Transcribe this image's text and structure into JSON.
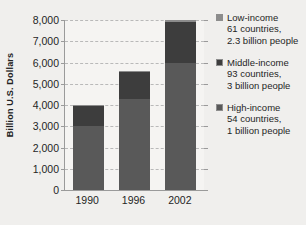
{
  "chart_data": {
    "type": "bar",
    "stacked": true,
    "title": "",
    "subtitle": "",
    "xlabel": "",
    "ylabel": "Billion U.S. Dollars",
    "categories": [
      "1990",
      "1996",
      "2002"
    ],
    "ylim": [
      0,
      8000
    ],
    "ytick_labels": [
      "0",
      "1,000",
      "2,000",
      "3,000",
      "4,000",
      "5,000",
      "6,000",
      "7,000",
      "8,000"
    ],
    "ytick_values": [
      0,
      1000,
      2000,
      3000,
      4000,
      5000,
      6000,
      7000,
      8000
    ],
    "grid": true,
    "grid_style": "dashed-horizontal",
    "legend_position": "right",
    "series": [
      {
        "name": "High-income",
        "color": "#595959",
        "values": [
          3000,
          4300,
          6000
        ]
      },
      {
        "name": "Middle-income",
        "color": "#3d3d3d",
        "values": [
          950,
          1250,
          1900
        ]
      },
      {
        "name": "Low-income",
        "color": "#8c8c8c",
        "values": [
          50,
          60,
          100
        ]
      }
    ],
    "totals": [
      4000,
      5610,
      8000
    ]
  },
  "axes": {
    "y_title": "Billion U.S. Dollars",
    "y_ticks": [
      {
        "label": "8,000",
        "value": 8000
      },
      {
        "label": "7,000",
        "value": 7000
      },
      {
        "label": "6,000",
        "value": 6000
      },
      {
        "label": "5,000",
        "value": 5000
      },
      {
        "label": "4,000",
        "value": 4000
      },
      {
        "label": "3,000",
        "value": 3000
      },
      {
        "label": "2,000",
        "value": 2000
      },
      {
        "label": "1,000",
        "value": 1000
      },
      {
        "label": "0",
        "value": 0
      }
    ],
    "x_ticks": [
      {
        "label": "1990"
      },
      {
        "label": "1996"
      },
      {
        "label": "2002"
      }
    ]
  },
  "legend": {
    "entries": [
      {
        "title": "Low-income",
        "line1": "61 countries,",
        "line2": "2.3 billion people",
        "color": "#8c8c8c"
      },
      {
        "title": "Middle-income",
        "line1": "93 countries,",
        "line2": "3 billion people",
        "color": "#3d3d3d"
      },
      {
        "title": "High-income",
        "line1": "54 countries,",
        "line2": "1 billion people",
        "color": "#595959"
      }
    ]
  },
  "colors": {
    "background": "#f0efed",
    "plot_background": "#f5f4f2",
    "axis": "#9a9a9a",
    "gridline": "#b9b9b9",
    "text": "#1f1f1f"
  }
}
